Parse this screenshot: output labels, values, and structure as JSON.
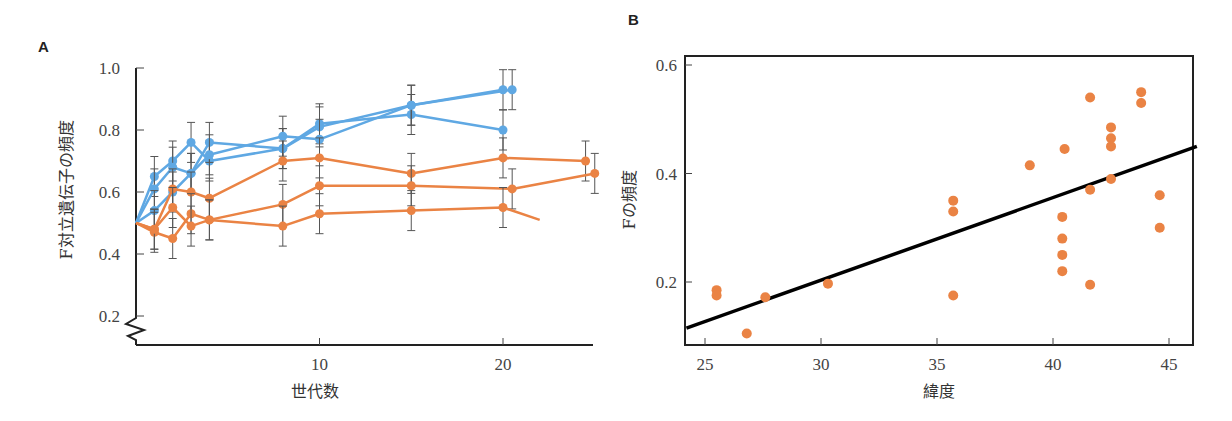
{
  "chart_data": [
    {
      "panel": "A",
      "type": "line",
      "title": "",
      "xlabel": "世代数",
      "ylabel": "F対立遺伝子の頻度",
      "xlim": [
        0,
        25
      ],
      "ylim": [
        0.2,
        1.0
      ],
      "axis_break": true,
      "grid": false,
      "xticks": [
        10,
        20
      ],
      "yticks": [
        0.2,
        0.4,
        0.6,
        0.8,
        1.0
      ],
      "ytick_labels": [
        "0.2",
        "0.4",
        "0.6",
        "0.8",
        "1.0"
      ],
      "error_bars": true,
      "series": [
        {
          "name": "blue-1",
          "color": "#5fa8e3",
          "x": [
            0,
            1,
            2,
            3,
            4,
            8,
            10,
            15,
            20
          ],
          "y": [
            0.5,
            0.65,
            0.7,
            0.76,
            0.7,
            0.74,
            0.82,
            0.85,
            0.8
          ]
        },
        {
          "name": "blue-2",
          "color": "#5fa8e3",
          "x": [
            0,
            1,
            2,
            3,
            4,
            8,
            10,
            15,
            20
          ],
          "y": [
            0.5,
            0.61,
            0.68,
            0.66,
            0.76,
            0.74,
            0.81,
            0.88,
            0.93
          ]
        },
        {
          "name": "blue-3",
          "color": "#5fa8e3",
          "x": [
            0,
            1,
            2,
            3,
            4,
            8,
            10,
            15,
            20.5
          ],
          "y": [
            0.5,
            0.54,
            0.6,
            0.66,
            0.72,
            0.78,
            0.77,
            0.88,
            0.93
          ]
        },
        {
          "name": "orange-1",
          "color": "#ea8344",
          "x": [
            0,
            1,
            2,
            3,
            4,
            8,
            10,
            15,
            20,
            24.5
          ],
          "y": [
            0.5,
            0.48,
            0.61,
            0.6,
            0.58,
            0.7,
            0.71,
            0.66,
            0.71,
            0.7
          ]
        },
        {
          "name": "orange-2",
          "color": "#ea8344",
          "x": [
            0,
            1,
            2,
            3,
            4,
            8,
            10,
            15,
            20.5,
            25
          ],
          "y": [
            0.5,
            0.47,
            0.45,
            0.53,
            0.51,
            0.56,
            0.62,
            0.62,
            0.61,
            0.66
          ]
        },
        {
          "name": "orange-3",
          "color": "#ea8344",
          "x": [
            0,
            1,
            2,
            3,
            4,
            8,
            10,
            15,
            20,
            22
          ],
          "y": [
            0.5,
            0.48,
            0.55,
            0.49,
            0.51,
            0.49,
            0.53,
            0.54,
            0.55,
            0.51
          ],
          "last_point_marker": false
        }
      ]
    },
    {
      "panel": "B",
      "type": "scatter",
      "title": "",
      "xlabel": "緯度",
      "ylabel": "Fの頻度",
      "xlim": [
        24.2,
        46.2
      ],
      "ylim": [
        0.08,
        0.62
      ],
      "grid": false,
      "xticks": [
        25,
        30,
        35,
        40,
        45
      ],
      "yticks": [
        0.2,
        0.4,
        0.6
      ],
      "ytick_labels": [
        "0.2",
        "0.4",
        "0.6"
      ],
      "point_color": "#ea8344",
      "points": [
        {
          "x": 25.5,
          "y": 0.185
        },
        {
          "x": 25.5,
          "y": 0.175
        },
        {
          "x": 26.8,
          "y": 0.105
        },
        {
          "x": 27.6,
          "y": 0.172
        },
        {
          "x": 30.3,
          "y": 0.197
        },
        {
          "x": 35.7,
          "y": 0.35
        },
        {
          "x": 35.7,
          "y": 0.33
        },
        {
          "x": 35.7,
          "y": 0.175
        },
        {
          "x": 39.0,
          "y": 0.415
        },
        {
          "x": 40.5,
          "y": 0.445
        },
        {
          "x": 40.4,
          "y": 0.32
        },
        {
          "x": 40.4,
          "y": 0.28
        },
        {
          "x": 40.4,
          "y": 0.25
        },
        {
          "x": 40.4,
          "y": 0.22
        },
        {
          "x": 41.6,
          "y": 0.54
        },
        {
          "x": 41.6,
          "y": 0.37
        },
        {
          "x": 41.6,
          "y": 0.195
        },
        {
          "x": 42.5,
          "y": 0.485
        },
        {
          "x": 42.5,
          "y": 0.465
        },
        {
          "x": 42.5,
          "y": 0.45
        },
        {
          "x": 42.5,
          "y": 0.39
        },
        {
          "x": 43.8,
          "y": 0.55
        },
        {
          "x": 43.8,
          "y": 0.53
        },
        {
          "x": 44.6,
          "y": 0.36
        },
        {
          "x": 44.6,
          "y": 0.3
        }
      ],
      "regression_line": {
        "x": [
          24.2,
          46.2
        ],
        "y": [
          0.115,
          0.45
        ],
        "color": "#000000"
      }
    }
  ],
  "panels": {
    "A": {
      "letter": "A",
      "xlabel": "世代数",
      "ylabel": "F対立遺伝子の頻度"
    },
    "B": {
      "letter": "B",
      "xlabel": "緯度",
      "ylabel": "Fの頻度"
    }
  }
}
